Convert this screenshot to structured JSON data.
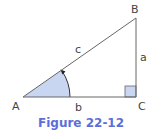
{
  "figure": {
    "caption": "Figure 22-12",
    "vertices": {
      "A": "A",
      "B": "B",
      "C": "C"
    },
    "sides": {
      "a": "a",
      "b": "b",
      "c": "c"
    },
    "right_angle_at": "C",
    "marked_angle_at": "A",
    "colors": {
      "line": "#555555",
      "fill": "#c9d6f2",
      "caption": "#5a6fd8"
    }
  }
}
